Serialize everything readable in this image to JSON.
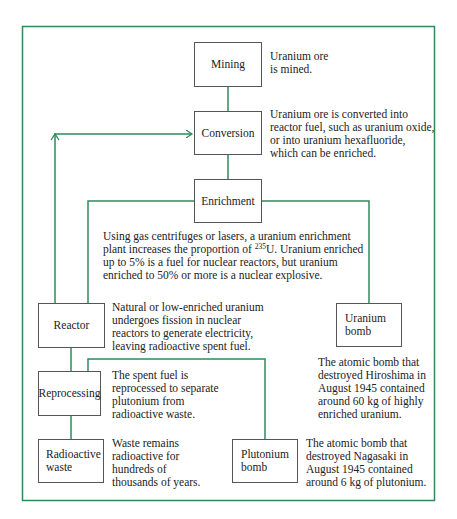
{
  "colors": {
    "frame": "#2e8b5c",
    "connector": "#2e8b5c",
    "box_border": "#555555",
    "text": "#222222"
  },
  "nodes": {
    "mining": {
      "label": [
        "Mining"
      ],
      "description": [
        "Uranium ore",
        "is mined."
      ]
    },
    "conversion": {
      "label": [
        "Conversion"
      ],
      "description": [
        "Uranium ore is converted into",
        "reactor fuel, such as uranium oxide,",
        "or into uranium hexafluoride,",
        "which can be enriched."
      ]
    },
    "enrichment": {
      "label": [
        "Enrichment"
      ],
      "description": {
        "line1": "Using gas centrifuges or lasers, a uranium enrichment",
        "line2_pre": "plant increases the proportion of ",
        "line2_sup": "235",
        "line2_post": "U. Uranium enriched",
        "line3": "up to 5% is a fuel for nuclear reactors, but uranium",
        "line4": "enriched to 50% or more is a nuclear explosive."
      }
    },
    "reactor": {
      "label": [
        "Reactor"
      ],
      "description": [
        "Natural or low-enriched uranium",
        "undergoes fission in nuclear",
        "reactors to generate electricity,",
        "leaving radioactive spent fuel."
      ]
    },
    "uranium_bomb": {
      "label": [
        "Uranium",
        "bomb"
      ],
      "description": [
        "The atomic bomb that",
        "destroyed Hiroshima in",
        "August 1945 contained",
        "around 60 kg of highly",
        "enriched uranium."
      ]
    },
    "reprocessing": {
      "label": [
        "Reprocessing"
      ],
      "description": [
        "The spent fuel is",
        "reprocessed to separate",
        "plutonium from",
        "radioactive waste."
      ]
    },
    "radioactive_waste": {
      "label": [
        "Radioactive",
        "waste"
      ],
      "description": [
        "Waste remains",
        "radioactive for",
        "hundreds of",
        "thousands of years."
      ]
    },
    "plutonium_bomb": {
      "label": [
        "Plutonium",
        "bomb"
      ],
      "description": [
        "The atomic bomb that",
        "destroyed Nagasaki in",
        "August 1945 contained",
        "around 6 kg of plutonium."
      ]
    }
  },
  "edges": [
    {
      "from": "mining",
      "to": "conversion",
      "arrow": false
    },
    {
      "from": "conversion",
      "to": "enrichment",
      "arrow": false
    },
    {
      "from": "enrichment",
      "to": "reactor",
      "arrow": false
    },
    {
      "from": "enrichment",
      "to": "uranium_bomb",
      "arrow": false
    },
    {
      "from": "reactor",
      "to": "conversion",
      "arrow": true,
      "label": "recycle"
    },
    {
      "from": "reactor",
      "to": "reprocessing",
      "arrow": false
    },
    {
      "from": "reprocessing",
      "to": "radioactive_waste",
      "arrow": false
    },
    {
      "from": "reprocessing",
      "to": "plutonium_bomb",
      "arrow": false
    }
  ]
}
